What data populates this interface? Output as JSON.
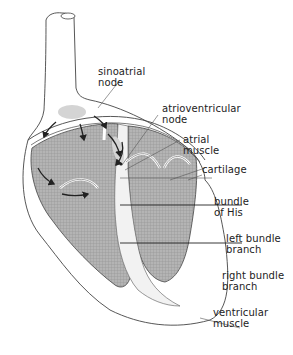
{
  "labels": {
    "sinoatrial_node": "sinoatrial\nnode",
    "atrioventricular_node": "atrioventricular\nnode",
    "atrial_muscle": "atrial\nmuscle",
    "cartilage": "cartilage",
    "bundle_of_his": "bundle\nof His",
    "left_bundle_branch": "left bundle\nbranch",
    "right_bundle_branch": "right bundle\nbranch",
    "ventricular_muscle": "ventricular\nmuscle"
  },
  "colors": {
    "outline": "#444444",
    "ventricle_fill": "#a8a8a8",
    "node_fill": "#d4d4d4",
    "leader_line": "#555555",
    "arrow": "#222222"
  }
}
